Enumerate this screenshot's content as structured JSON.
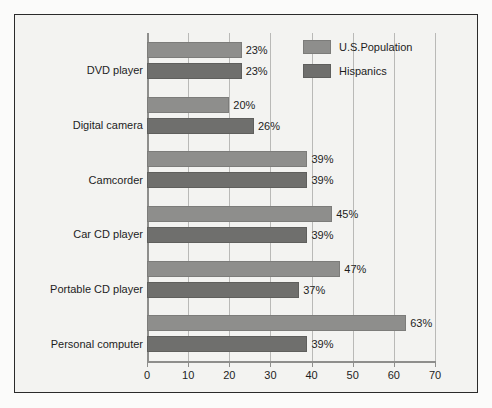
{
  "chart_data": {
    "type": "bar",
    "orientation": "horizontal",
    "title": "",
    "xlabel": "",
    "ylabel": "",
    "xlim": [
      0,
      70
    ],
    "xticks": [
      "0",
      "10",
      "20",
      "30",
      "40",
      "50",
      "60",
      "70"
    ],
    "grid": true,
    "legend_position": "top-right",
    "value_suffix": "%",
    "categories": [
      "DVD player",
      "Digital camera",
      "Camcorder",
      "Car CD player",
      "Portable CD player",
      "Personal computer"
    ],
    "series": [
      {
        "name": "U.S.Population",
        "color": "#8e8e8c",
        "values": [
          23,
          20,
          39,
          45,
          47,
          63
        ],
        "labels": [
          "23%",
          "20%",
          "39%",
          "45%",
          "47%",
          "63%"
        ]
      },
      {
        "name": "Hispanics",
        "color": "#6f6f6d",
        "values": [
          23,
          26,
          39,
          39,
          37,
          39
        ],
        "labels": [
          "23%",
          "26%",
          "39%",
          "39%",
          "37%",
          "39%"
        ]
      }
    ]
  },
  "legend": {
    "entries": [
      {
        "label": "U.S.Population"
      },
      {
        "label": "Hispanics"
      }
    ]
  },
  "colors": {
    "series_us": "#8e8e8c",
    "series_hispanics": "#6f6f6d",
    "gridline": "#b9b9b7",
    "axis": "#8e8e8c",
    "frame_border": "#2b2b2b",
    "plot_background": "#f3f3f1",
    "text": "#1d1d1d"
  }
}
